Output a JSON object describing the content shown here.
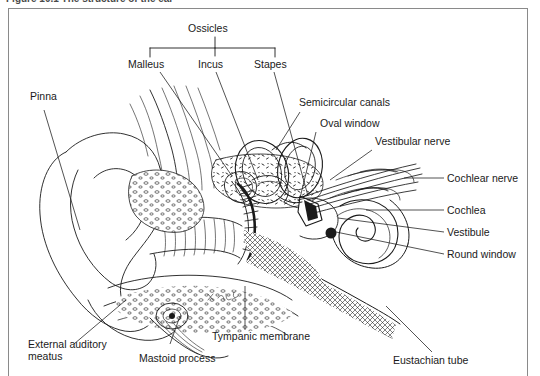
{
  "figure": {
    "caption": "Figure 10.1   The structure of the ear",
    "frame_color": "#8a8a8a",
    "line_color": "#1a1a1a",
    "background": "#ffffff"
  },
  "group_label": {
    "name": "Ossicles",
    "members": [
      "Malleus",
      "Incus",
      "Stapes"
    ]
  },
  "labels": {
    "ossicles": "Ossicles",
    "malleus": "Malleus",
    "incus": "Incus",
    "stapes": "Stapes",
    "pinna": "Pinna",
    "semicircular_canals": "Semicircular canals",
    "oval_window": "Oval window",
    "vestibular_nerve": "Vestibular nerve",
    "cochlear_nerve": "Cochlear nerve",
    "cochlea": "Cochlea",
    "vestibule": "Vestibule",
    "round_window": "Round window",
    "external_auditory_meatus": "External auditory meatus",
    "mastoid_process": "Mastoid process",
    "tympanic_membrane": "Tympanic membrane",
    "eustachian_tube": "Eustachian tube"
  },
  "diagram": {
    "type": "anatomical-line-drawing",
    "regions": [
      "outer ear",
      "middle ear",
      "inner ear"
    ],
    "structures_drawn": [
      "pinna",
      "external auditory meatus",
      "tympanic membrane",
      "malleus",
      "incus",
      "stapes",
      "semicircular canals",
      "oval window",
      "round window",
      "vestibule",
      "cochlea",
      "vestibular nerve",
      "cochlear nerve",
      "eustachian tube",
      "mastoid process"
    ]
  }
}
